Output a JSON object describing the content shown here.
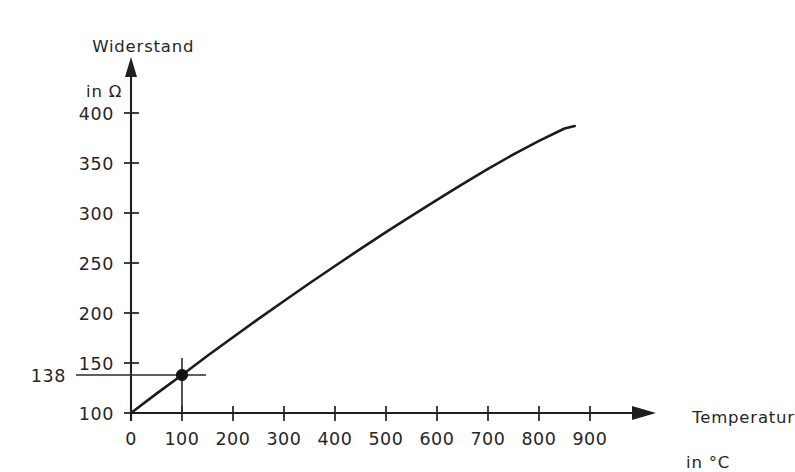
{
  "chart_data": {
    "type": "line",
    "title": "",
    "xlabel": "Temperatur in °C",
    "ylabel": "Widerstand in Ω",
    "xlabel_line1": "Temperatur",
    "xlabel_line2": "in °C",
    "ylabel_line1": "Widerstand",
    "ylabel_line2": "in Ω",
    "xlim": [
      0,
      900
    ],
    "ylim": [
      100,
      400
    ],
    "grid": false,
    "legend": null,
    "x_ticks": [
      0,
      100,
      200,
      300,
      400,
      500,
      600,
      700,
      800,
      900
    ],
    "x_tick_labels": [
      "0",
      "100",
      "200",
      "300",
      "400",
      "500",
      "600",
      "700",
      "800",
      "900"
    ],
    "y_ticks": [
      100,
      150,
      200,
      250,
      300,
      350,
      400
    ],
    "y_tick_labels": [
      "100",
      "150",
      "200",
      "250",
      "300",
      "350",
      "400"
    ],
    "series": [
      {
        "name": "Widerstandskennlinie",
        "x": [
          0,
          50,
          100,
          150,
          200,
          250,
          300,
          350,
          400,
          450,
          500,
          550,
          600,
          650,
          700,
          750,
          800,
          850,
          870
        ],
        "values": [
          100,
          119.4,
          138,
          157.3,
          175.8,
          194.1,
          212.0,
          229.7,
          247.0,
          264.2,
          280.8,
          297.2,
          313.2,
          328.8,
          344.2,
          358.6,
          372.2,
          384.5,
          387.0
        ]
      }
    ],
    "annotations": [
      {
        "name": "operating-point",
        "x": 100,
        "y": 138,
        "label": "138",
        "marker": "dot",
        "guide_horizontal": true,
        "guide_vertical": true
      }
    ],
    "colors": {
      "curve": "#1c1c1c",
      "axis": "#1f1f1f",
      "guide": "#2a2a2a",
      "marker": "#121212",
      "text": "#262626",
      "background": "#ffffff"
    }
  }
}
